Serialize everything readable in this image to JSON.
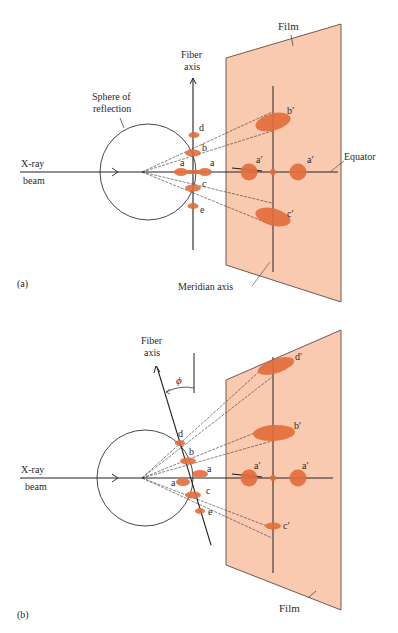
{
  "colors": {
    "film": "#f9c9b0",
    "film_edge": "#6e5a50",
    "spot": "#e46d3a",
    "line": "#222222",
    "background": "#ffffff"
  },
  "panel_a": {
    "tag": "(a)",
    "labels": {
      "film": "Film",
      "fiber_axis_line1": "Fiber",
      "fiber_axis_line2": "axis",
      "sphere_line1": "Sphere of",
      "sphere_line2": "reflection",
      "xray_line1": "X-ray",
      "xray_line2": "beam",
      "equator": "Equator",
      "meridian": "Meridian axis"
    },
    "spots_near": [
      "d",
      "b",
      "a",
      "a",
      "c",
      "e"
    ],
    "spots_film": [
      "b′",
      "a′",
      "a′",
      "c′"
    ]
  },
  "panel_b": {
    "tag": "(b)",
    "labels": {
      "film": "Film",
      "fiber_axis_line1": "Fiber",
      "fiber_axis_line2": "axis",
      "angle": "ϕ",
      "xray_line1": "X-ray",
      "xray_line2": "beam"
    },
    "spots_near": [
      "d",
      "b",
      "a",
      "a",
      "c",
      "e"
    ],
    "spots_film": [
      "d′",
      "b′",
      "a′",
      "a′",
      "c′"
    ]
  }
}
